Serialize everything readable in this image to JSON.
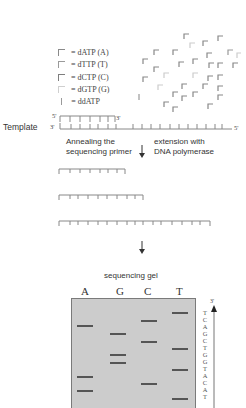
{
  "legend": {
    "items": [
      {
        "label": "= dATP (A)",
        "color": "#8a8a8a"
      },
      {
        "label": "= dTTP (T)",
        "color": "#9a9a9a"
      },
      {
        "label": "= dCTP (C)",
        "color": "#7e7e7e"
      },
      {
        "label": "= dGTP (G)",
        "color": "#c8c8c8"
      },
      {
        "label": "= ddATP",
        "color": "#9a9a9a"
      }
    ]
  },
  "template": {
    "label": "Template",
    "left_end": "3'",
    "right_end": "5'",
    "primer_5": "5'",
    "primer_3": "3'"
  },
  "steps": {
    "annealing_line1": "Annealing the",
    "annealing_line2": "sequencing primer",
    "extension_line1": "extension with",
    "extension_line2": "DNA polymerase"
  },
  "gel": {
    "title": "sequencing gel",
    "lanes": [
      "A",
      "G",
      "C",
      "T"
    ],
    "bands": [
      {
        "lane": "T",
        "y": 313
      },
      {
        "lane": "C",
        "y": 321
      },
      {
        "lane": "A",
        "y": 326
      },
      {
        "lane": "G",
        "y": 334
      },
      {
        "lane": "C",
        "y": 342
      },
      {
        "lane": "T",
        "y": 349
      },
      {
        "lane": "G",
        "y": 355
      },
      {
        "lane": "G",
        "y": 363
      },
      {
        "lane": "T",
        "y": 370
      },
      {
        "lane": "A",
        "y": 377
      },
      {
        "lane": "C",
        "y": 384
      },
      {
        "lane": "A",
        "y": 391
      },
      {
        "lane": "T",
        "y": 399
      }
    ],
    "read_label": "3'",
    "sequence": [
      "T",
      "C",
      "A",
      "G",
      "C",
      "T",
      "G",
      "G",
      "T",
      "A",
      "C",
      "A",
      "T"
    ]
  }
}
